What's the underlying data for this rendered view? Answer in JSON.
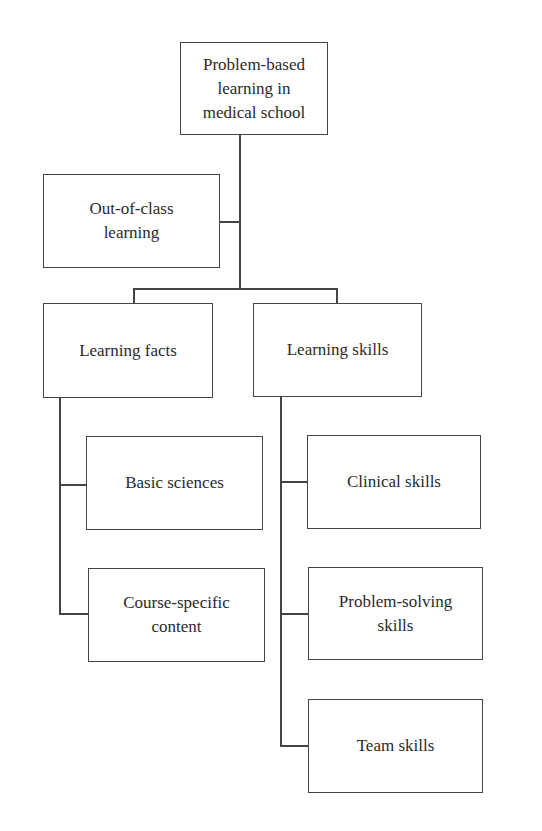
{
  "diagram": {
    "type": "hierarchy",
    "root": {
      "label": "Problem-based learning in medical school",
      "lines": [
        "Problem-based",
        "learning in",
        "medical school"
      ]
    },
    "side_node": {
      "label": "Out-of-class learning",
      "lines": [
        "Out-of-class",
        "learning"
      ]
    },
    "branches": [
      {
        "label": "Learning facts",
        "lines": [
          "Learning facts"
        ],
        "children": [
          {
            "label": "Basic sciences",
            "lines": [
              "Basic sciences"
            ]
          },
          {
            "label": "Course-specific content",
            "lines": [
              "Course-specific",
              "content"
            ]
          }
        ]
      },
      {
        "label": "Learning skills",
        "lines": [
          "Learning skills"
        ],
        "children": [
          {
            "label": "Clinical skills",
            "lines": [
              "Clinical skills"
            ]
          },
          {
            "label": "Problem-solving skills",
            "lines": [
              "Problem-solving",
              "skills"
            ]
          },
          {
            "label": "Team skills",
            "lines": [
              "Team skills"
            ]
          }
        ]
      }
    ]
  }
}
